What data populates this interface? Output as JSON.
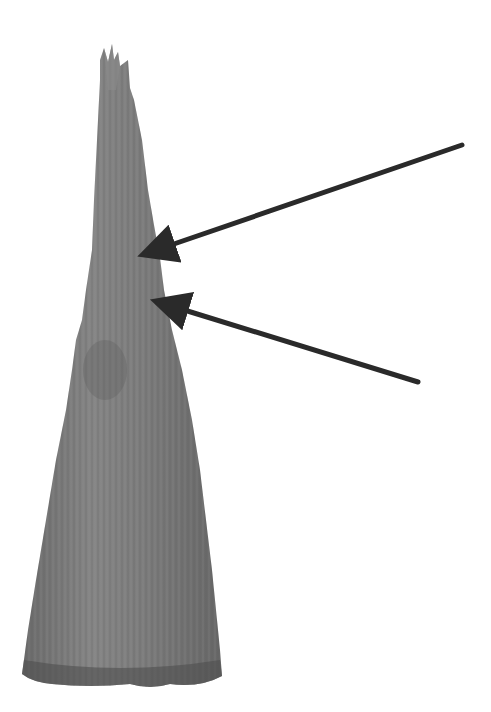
{
  "figure": {
    "background": "#ffffff",
    "specimen": {
      "label": "tapered fibrous specimen",
      "fill": "#7a7a7a",
      "shade": "#5e5e5e",
      "highlight": "#9a9a9a"
    },
    "arrows": [
      {
        "name": "upper-arrow",
        "color": "#2a2a2a",
        "from": [
          462,
          145
        ],
        "to": [
          157,
          250
        ]
      },
      {
        "name": "lower-arrow",
        "color": "#2a2a2a",
        "from": [
          418,
          382
        ],
        "to": [
          170,
          305
        ]
      }
    ]
  }
}
